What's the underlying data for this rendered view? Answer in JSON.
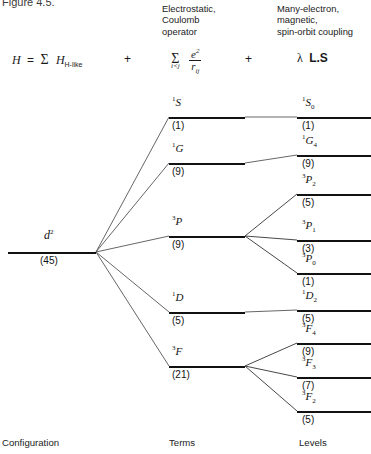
{
  "figure": {
    "caption": "Figure 4.5."
  },
  "headers": {
    "col2": [
      "Electrostatic,",
      "Coulomb",
      "operator"
    ],
    "col3": [
      "Many-electron,",
      "magnetic,",
      "spin-orbit coupling"
    ]
  },
  "equation": {
    "lhs": "H",
    "equals": "=",
    "sigma": "Σ",
    "term1": "H",
    "term1_sub": "H-like",
    "plus1": "+",
    "sigma2": "Σ",
    "sigma2_sub": "i<j",
    "numerator": "e",
    "numerator_sup": "2",
    "denominator": "r",
    "denominator_sub": "ij",
    "plus2": "+",
    "lambda": "λ",
    "ls": "L.S"
  },
  "configuration": {
    "symbol": "d",
    "exponent": "2",
    "degeneracy": "(45)"
  },
  "terms": [
    {
      "multiplicity": "1",
      "letter": "S",
      "degeneracy": "(1)"
    },
    {
      "multiplicity": "1",
      "letter": "G",
      "degeneracy": "(9)"
    },
    {
      "multiplicity": "3",
      "letter": "P",
      "degeneracy": "(9)"
    },
    {
      "multiplicity": "1",
      "letter": "D",
      "degeneracy": "(5)"
    },
    {
      "multiplicity": "3",
      "letter": "F",
      "degeneracy": "(21)"
    }
  ],
  "levels": [
    {
      "multiplicity": "1",
      "letter": "S",
      "j": "0",
      "degeneracy": "(1)"
    },
    {
      "multiplicity": "1",
      "letter": "G",
      "j": "4",
      "degeneracy": "(9)"
    },
    {
      "multiplicity": "3",
      "letter": "P",
      "j": "2",
      "degeneracy": "(5)"
    },
    {
      "multiplicity": "3",
      "letter": "P",
      "j": "1",
      "degeneracy": "(3)"
    },
    {
      "multiplicity": "3",
      "letter": "P",
      "j": "0",
      "degeneracy": "(1)"
    },
    {
      "multiplicity": "1",
      "letter": "D",
      "j": "2",
      "degeneracy": "(5)"
    },
    {
      "multiplicity": "3",
      "letter": "F",
      "j": "4",
      "degeneracy": "(9)"
    },
    {
      "multiplicity": "3",
      "letter": "F",
      "j": "3",
      "degeneracy": "(7)"
    },
    {
      "multiplicity": "3",
      "letter": "F",
      "j": "2",
      "degeneracy": "(5)"
    }
  ],
  "footer": {
    "col1": "Configuration",
    "col2": "Terms",
    "col3": "Levels"
  },
  "colors": {
    "line": "#111111",
    "thin_line": "#555555",
    "text": "#1a1a1a"
  }
}
